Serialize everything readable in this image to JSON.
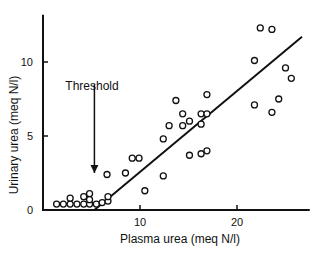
{
  "chart_data": {
    "type": "scatter",
    "title": "",
    "xlabel": "Plasma urea (meq N/l)",
    "ylabel": "Urinary urea (meq N/l)",
    "xlim": [
      0,
      27.5
    ],
    "ylim": [
      0,
      13
    ],
    "x_ticks": [
      10,
      20
    ],
    "y_ticks": [
      0,
      5,
      10
    ],
    "grid": false,
    "legend": null,
    "annotation": {
      "text": "Threshold",
      "x": 5.3,
      "arrow_from_y": 8.5,
      "arrow_to_y": 2.5
    },
    "fit_line": {
      "x": [
        5.3,
        26.7
      ],
      "y": [
        0,
        11.7
      ]
    },
    "points": [
      {
        "x": 1.4,
        "y": 0.4
      },
      {
        "x": 2.1,
        "y": 0.4
      },
      {
        "x": 2.8,
        "y": 0.4
      },
      {
        "x": 2.8,
        "y": 0.8
      },
      {
        "x": 3.5,
        "y": 0.4
      },
      {
        "x": 4.2,
        "y": 0.4
      },
      {
        "x": 4.2,
        "y": 0.9
      },
      {
        "x": 4.8,
        "y": 0.4
      },
      {
        "x": 4.8,
        "y": 1.1
      },
      {
        "x": 4.8,
        "y": 0.7
      },
      {
        "x": 5.5,
        "y": 0.4
      },
      {
        "x": 6.1,
        "y": 0.5
      },
      {
        "x": 6.7,
        "y": 0.6
      },
      {
        "x": 6.7,
        "y": 0.9
      },
      {
        "x": 6.6,
        "y": 2.4
      },
      {
        "x": 8.5,
        "y": 2.5
      },
      {
        "x": 9.2,
        "y": 3.5
      },
      {
        "x": 9.9,
        "y": 3.5
      },
      {
        "x": 10.5,
        "y": 1.3
      },
      {
        "x": 12.4,
        "y": 4.8
      },
      {
        "x": 12.4,
        "y": 2.3
      },
      {
        "x": 13.0,
        "y": 5.7
      },
      {
        "x": 13.7,
        "y": 7.4
      },
      {
        "x": 14.4,
        "y": 6.5
      },
      {
        "x": 14.4,
        "y": 5.7
      },
      {
        "x": 15.1,
        "y": 3.7
      },
      {
        "x": 15.1,
        "y": 6.0
      },
      {
        "x": 16.3,
        "y": 3.8
      },
      {
        "x": 16.3,
        "y": 6.5
      },
      {
        "x": 16.3,
        "y": 5.8
      },
      {
        "x": 16.9,
        "y": 6.5
      },
      {
        "x": 16.9,
        "y": 4.0
      },
      {
        "x": 16.9,
        "y": 7.8
      },
      {
        "x": 21.8,
        "y": 10.1
      },
      {
        "x": 21.8,
        "y": 7.1
      },
      {
        "x": 22.4,
        "y": 12.3
      },
      {
        "x": 23.6,
        "y": 12.2
      },
      {
        "x": 23.6,
        "y": 6.6
      },
      {
        "x": 24.3,
        "y": 7.5
      },
      {
        "x": 25.0,
        "y": 9.6
      },
      {
        "x": 25.6,
        "y": 8.9
      }
    ]
  }
}
